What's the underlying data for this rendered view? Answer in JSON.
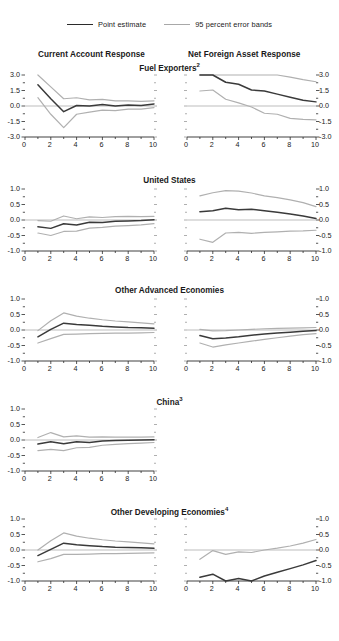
{
  "legend": {
    "items": [
      {
        "label": "Point estimate",
        "style": "solid-dark",
        "color": "#3a3a3a"
      },
      {
        "label": "95 percent error bands",
        "style": "solid-light",
        "color": "#b0b0b0"
      }
    ]
  },
  "column_headers": {
    "left": "Current Account Response",
    "right": "Net Foreign Asset Response"
  },
  "chart_data": {
    "type": "line",
    "legend_position": "top-center",
    "grid": false,
    "xlabel": "",
    "ylabel": "",
    "x": [
      1,
      2,
      3,
      4,
      5,
      6,
      7,
      8,
      9,
      10
    ],
    "xlim": [
      0,
      10
    ],
    "xticks": [
      0,
      2,
      4,
      6,
      8,
      10
    ],
    "panels": [
      {
        "row_title": "Fuel Exporters",
        "row_title_superscript": "2",
        "left": {
          "column": "Current Account Response",
          "ylim": [
            -3.0,
            3.0
          ],
          "yticks": [
            3.0,
            1.5,
            0.0,
            -1.5,
            -3.0
          ],
          "ytick_labels": [
            "3.0",
            "1.5",
            "0.0",
            "-1.5",
            "-3.0"
          ],
          "series": [
            {
              "name": "Point estimate",
              "values": [
                2.05,
                0.7,
                -0.55,
                0.05,
                0.0,
                0.15,
                0.0,
                0.1,
                0.05,
                0.2
              ]
            },
            {
              "name": "Upper 95 percent band",
              "values": [
                3.05,
                1.85,
                0.7,
                0.8,
                0.6,
                0.65,
                0.5,
                0.5,
                0.45,
                0.5
              ]
            },
            {
              "name": "Lower 95 percent band",
              "values": [
                0.8,
                -0.8,
                -2.1,
                -0.8,
                -0.6,
                -0.4,
                -0.45,
                -0.3,
                -0.3,
                -0.15
              ]
            }
          ]
        },
        "right": {
          "column": "Net Foreign Asset Response",
          "ylim": [
            -3.0,
            3.0
          ],
          "yticks": [
            3.0,
            1.5,
            0.0,
            -1.5,
            -3.0
          ],
          "ytick_labels": [
            "3.0",
            "1.5",
            "0.0",
            "-1.5",
            "-3.0"
          ],
          "series": [
            {
              "name": "Point estimate",
              "values": [
                3.2,
                3.55,
                2.3,
                2.1,
                1.55,
                1.45,
                1.15,
                0.85,
                0.55,
                0.4
              ]
            },
            {
              "name": "Upper 95 percent band",
              "values": [
                5.1,
                5.4,
                4.6,
                4.4,
                4.2,
                3.4,
                3.15,
                2.8,
                2.55,
                2.35
              ]
            },
            {
              "name": "Lower 95 percent band",
              "values": [
                1.45,
                1.55,
                0.65,
                0.3,
                -0.1,
                -0.7,
                -0.8,
                -1.2,
                -1.3,
                -1.35
              ]
            }
          ]
        }
      },
      {
        "row_title": "United States",
        "row_title_superscript": "",
        "left": {
          "column": "Current Account Response",
          "ylim": [
            -1.0,
            1.0
          ],
          "yticks": [
            1.0,
            0.5,
            0.0,
            -0.5,
            -1.0
          ],
          "ytick_labels": [
            "1.0",
            "0.5",
            "0.0",
            "-0.5",
            "-1.0"
          ],
          "series": [
            {
              "name": "Point estimate",
              "values": [
                -0.22,
                -0.27,
                -0.12,
                -0.16,
                -0.07,
                -0.08,
                -0.04,
                -0.03,
                -0.02,
                0.01
              ]
            },
            {
              "name": "Upper 95 percent band",
              "values": [
                -0.02,
                -0.04,
                0.13,
                0.04,
                0.1,
                0.08,
                0.11,
                0.12,
                0.11,
                0.12
              ]
            },
            {
              "name": "Lower 95 percent band",
              "values": [
                -0.42,
                -0.5,
                -0.37,
                -0.36,
                -0.26,
                -0.24,
                -0.2,
                -0.18,
                -0.16,
                -0.12
              ]
            }
          ]
        },
        "right": {
          "column": "Net Foreign Asset Response",
          "ylim": [
            -1.0,
            1.0
          ],
          "yticks": [
            1.0,
            0.5,
            0.0,
            -0.5,
            -1.0
          ],
          "ytick_labels": [
            "1.0",
            "0.5",
            "0.0",
            "-0.5",
            "-1.0"
          ],
          "series": [
            {
              "name": "Point estimate",
              "values": [
                0.27,
                0.3,
                0.38,
                0.33,
                0.35,
                0.3,
                0.25,
                0.19,
                0.13,
                0.05
              ]
            },
            {
              "name": "Upper 95 percent band",
              "values": [
                0.78,
                0.88,
                0.95,
                0.93,
                0.87,
                0.78,
                0.72,
                0.65,
                0.56,
                0.43
              ]
            },
            {
              "name": "Lower 95 percent band",
              "values": [
                -0.62,
                -0.72,
                -0.42,
                -0.4,
                -0.43,
                -0.4,
                -0.38,
                -0.36,
                -0.35,
                -0.33
              ]
            }
          ]
        }
      },
      {
        "row_title": "Other Advanced Economies",
        "row_title_superscript": "",
        "left": {
          "column": "Current Account Response",
          "ylim": [
            -1.0,
            1.0
          ],
          "yticks": [
            1.0,
            0.5,
            0.0,
            -0.5,
            -1.0
          ],
          "ytick_labels": [
            "1.0",
            "0.5",
            "0.0",
            "-0.5",
            "-1.0"
          ],
          "series": [
            {
              "name": "Point estimate",
              "values": [
                -0.22,
                0.02,
                0.22,
                0.18,
                0.15,
                0.12,
                0.1,
                0.08,
                0.07,
                0.06
              ]
            },
            {
              "name": "Upper 95 percent band",
              "values": [
                -0.02,
                0.3,
                0.55,
                0.45,
                0.38,
                0.33,
                0.29,
                0.26,
                0.23,
                0.2
              ]
            },
            {
              "name": "Lower 95 percent band",
              "values": [
                -0.42,
                -0.28,
                -0.14,
                -0.13,
                -0.12,
                -0.11,
                -0.1,
                -0.1,
                -0.09,
                -0.08
              ]
            }
          ]
        },
        "right": {
          "column": "Net Foreign Asset Response",
          "ylim": [
            -1.0,
            1.0
          ],
          "yticks": [
            1.0,
            0.5,
            0.0,
            -0.5,
            -1.0
          ],
          "ytick_labels": [
            "1.0",
            "0.5",
            "0.0",
            "-0.5",
            "-1.0"
          ],
          "series": [
            {
              "name": "Point estimate",
              "values": [
                -0.18,
                -0.28,
                -0.26,
                -0.22,
                -0.17,
                -0.13,
                -0.1,
                -0.07,
                -0.04,
                -0.02
              ]
            },
            {
              "name": "Upper 95 percent band",
              "values": [
                0.02,
                -0.03,
                -0.02,
                0.0,
                0.02,
                0.04,
                0.05,
                0.06,
                0.07,
                0.08
              ]
            },
            {
              "name": "Lower 95 percent band",
              "values": [
                -0.42,
                -0.55,
                -0.48,
                -0.42,
                -0.36,
                -0.3,
                -0.25,
                -0.2,
                -0.15,
                -0.12
              ]
            }
          ]
        }
      },
      {
        "row_title": "China",
        "row_title_superscript": "3",
        "left": {
          "column": "Current Account Response",
          "ylim": [
            -1.0,
            1.0
          ],
          "yticks": [
            1.0,
            0.5,
            0.0,
            -0.5,
            -1.0
          ],
          "ytick_labels": [
            "1.0",
            "0.5",
            "0.0",
            "-0.5",
            "-1.0"
          ],
          "series": [
            {
              "name": "Point estimate",
              "values": [
                -0.13,
                -0.06,
                -0.12,
                -0.06,
                -0.08,
                -0.03,
                -0.02,
                -0.01,
                0.0,
                0.01
              ]
            },
            {
              "name": "Upper 95 percent band",
              "values": [
                0.08,
                0.24,
                0.1,
                0.13,
                0.09,
                0.1,
                0.09,
                0.09,
                0.09,
                0.1
              ]
            },
            {
              "name": "Lower 95 percent band",
              "values": [
                -0.34,
                -0.3,
                -0.34,
                -0.25,
                -0.24,
                -0.17,
                -0.14,
                -0.12,
                -0.1,
                -0.08
              ]
            }
          ]
        },
        "right": null
      },
      {
        "row_title": "Other Developing Economies",
        "row_title_superscript": "4",
        "left": {
          "column": "Current Account Response",
          "ylim": [
            -1.0,
            1.0
          ],
          "yticks": [
            1.0,
            0.5,
            0.0,
            -0.5,
            -1.0
          ],
          "ytick_labels": [
            "1.0",
            "0.5",
            "0.0",
            "-0.5",
            "-1.0"
          ],
          "series": [
            {
              "name": "Point estimate",
              "values": [
                -0.18,
                0.02,
                0.22,
                0.17,
                0.14,
                0.11,
                0.09,
                0.08,
                0.07,
                0.06
              ]
            },
            {
              "name": "Upper 95 percent band",
              "values": [
                0.0,
                0.3,
                0.55,
                0.45,
                0.38,
                0.33,
                0.29,
                0.26,
                0.23,
                0.2
              ]
            },
            {
              "name": "Lower 95 percent band",
              "values": [
                -0.38,
                -0.28,
                -0.14,
                -0.14,
                -0.13,
                -0.12,
                -0.12,
                -0.11,
                -0.1,
                -0.09
              ]
            }
          ]
        },
        "right": {
          "column": "Net Foreign Asset Response",
          "ylim": [
            -1.0,
            1.0
          ],
          "yticks": [
            1.0,
            0.5,
            0.0,
            -0.5,
            -1.0
          ],
          "ytick_labels": [
            "1.0",
            "0.5",
            "0.0",
            "-0.5",
            "-1.0"
          ],
          "series": [
            {
              "name": "Point estimate",
              "values": [
                -0.88,
                -0.78,
                -1.0,
                -0.92,
                -1.0,
                -0.84,
                -0.72,
                -0.6,
                -0.48,
                -0.34
              ]
            },
            {
              "name": "Upper 95 percent band",
              "values": [
                -0.3,
                -0.02,
                -0.14,
                -0.06,
                -0.08,
                0.0,
                0.06,
                0.13,
                0.22,
                0.34
              ]
            },
            {
              "name": "Lower 95 percent band",
              "values": [
                null,
                null,
                null,
                null,
                null,
                null,
                null,
                null,
                null,
                null
              ]
            }
          ]
        }
      }
    ]
  }
}
